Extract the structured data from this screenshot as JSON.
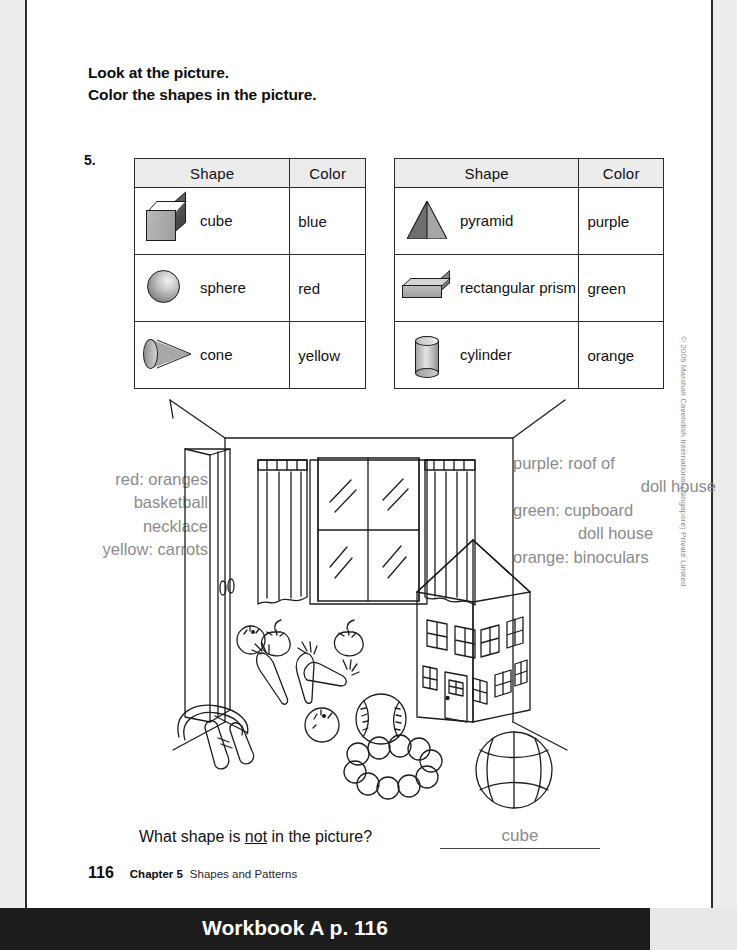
{
  "instructions": {
    "line1": "Look at the picture.",
    "line2": "Color the shapes in the picture."
  },
  "question_number": "5.",
  "tables": {
    "left": {
      "headers": [
        "Shape",
        "Color"
      ],
      "rows": [
        {
          "icon": "cube-icon",
          "shape": "cube",
          "color": "blue"
        },
        {
          "icon": "sphere-icon",
          "shape": "sphere",
          "color": "red"
        },
        {
          "icon": "cone-icon",
          "shape": "cone",
          "color": "yellow"
        }
      ]
    },
    "right": {
      "headers": [
        "Shape",
        "Color"
      ],
      "rows": [
        {
          "icon": "pyramid-icon",
          "shape": "pyramid",
          "color": "purple"
        },
        {
          "icon": "rectangular-prism-icon",
          "shape": "rectangular prism",
          "color": "green"
        },
        {
          "icon": "cylinder-icon",
          "shape": "cylinder",
          "color": "orange"
        }
      ]
    }
  },
  "annotations": {
    "left": [
      "red: oranges",
      "basketball",
      "necklace",
      "yellow: carrots"
    ],
    "right": [
      "purple: roof of",
      "doll house",
      "green: cupboard",
      "doll house",
      "orange: binoculars"
    ]
  },
  "scene": {
    "objects": [
      "cupboard",
      "window",
      "curtains",
      "doll-house",
      "jump-rope",
      "oranges",
      "carrots",
      "tomatoes",
      "baseball",
      "bead-necklace",
      "basketball"
    ]
  },
  "bottom_question": {
    "prefix": "What shape is ",
    "emphasis": "not",
    "suffix": " in the picture?",
    "answer": "cube"
  },
  "footer": {
    "page_number": "116",
    "chapter": "Chapter 5",
    "chapter_title": "Shapes and Patterns"
  },
  "copyright": "© 2009 Marshall Cavendish International (Singapore) Private Limited",
  "bottom_bar": {
    "label": "Workbook A p. 116"
  },
  "colors": {
    "ink": "#111111",
    "handwriting": "#8b8b8b",
    "table_header_bg": "#ececed",
    "bar_bg": "#1c1c1c"
  }
}
